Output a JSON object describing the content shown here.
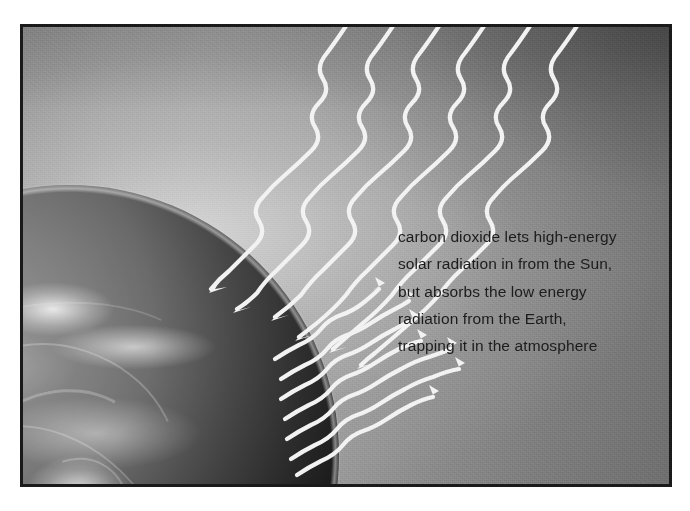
{
  "figure": {
    "name": "greenhouse-effect-illustration",
    "frame_border_color": "#1a1a1a",
    "background_color": "#ffffff"
  },
  "scene": {
    "earth": {
      "label": "Earth",
      "description": "partial globe in lower-left showing swirling cloud systems and continents"
    },
    "sky": {
      "label": "atmosphere and space",
      "gradient_light": "#b4b4b4",
      "gradient_dark": "#6f6f6f"
    }
  },
  "caption": {
    "text_color": "#1c1c1c",
    "lines": [
      "carbon dioxide lets high-energy",
      "solar radiation in from the Sun,",
      "but absorbs the low energy",
      "radiation from the Earth,",
      "trapping it in the atmosphere"
    ],
    "full_text": "carbon dioxide lets high-energy solar radiation in from the Sun, but absorbs the low energy radiation from the Earth, trapping it in the atmosphere"
  },
  "rays": {
    "stroke_color": "#f2f2f2",
    "incoming": {
      "name": "incoming-solar-radiation",
      "label": "high-energy solar radiation from the Sun",
      "direction": "down-left",
      "count": 6
    },
    "outgoing": {
      "name": "outgoing-earth-radiation",
      "label": "low energy radiation from the Earth",
      "direction": "up-right",
      "count": 6
    }
  }
}
